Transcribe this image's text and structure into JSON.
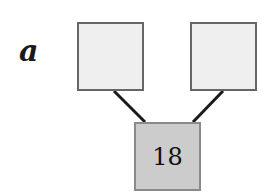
{
  "diagram": {
    "label": "a",
    "type": "number-bond",
    "parts": [
      {
        "position": "top-left",
        "value": ""
      },
      {
        "position": "top-right",
        "value": ""
      }
    ],
    "whole": {
      "position": "bottom",
      "value": "18"
    },
    "colors": {
      "part_fill": "#efefef",
      "whole_fill": "#cccccc",
      "border": "#666666",
      "connector": "#1a1a1a"
    }
  }
}
